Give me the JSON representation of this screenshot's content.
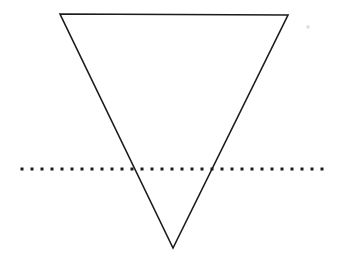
{
  "figure": {
    "background_color": "#ffffff",
    "width": 341,
    "height": 267
  },
  "chart_data": {
    "type": "diagram",
    "shapes": [
      {
        "name": "inverted-triangle",
        "kind": "polygon",
        "stroke_color": "#1c1c1c",
        "stroke_width": 1.6,
        "fill": "none",
        "vertices": [
          {
            "label": "top-left",
            "x": 60,
            "y": 14
          },
          {
            "label": "top-right",
            "x": 288,
            "y": 15
          },
          {
            "label": "bottom-apex",
            "x": 173,
            "y": 248
          }
        ]
      },
      {
        "name": "dotted-horizontal-line",
        "kind": "dotted-line",
        "color": "#1b1b1b",
        "y": 169,
        "x_start": 22,
        "x_end": 322,
        "dot_size": 3,
        "dot_spacing": 10,
        "dot_count": 31
      }
    ],
    "intersections": [
      {
        "label": "left-edge-crossing",
        "x": 134,
        "y": 169
      },
      {
        "label": "right-edge-crossing",
        "x": 212,
        "y": 169
      }
    ],
    "artifacts": [
      {
        "name": "scan-speck",
        "x": 308,
        "y": 27,
        "size": 3,
        "color": "#dcdcdc"
      }
    ],
    "labels": [],
    "legend": [],
    "axes": null,
    "grid": false
  }
}
